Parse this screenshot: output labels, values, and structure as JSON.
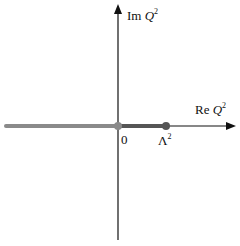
{
  "diagram": {
    "type": "complex-plane",
    "axes": {
      "imaginary_label_prefix": "Im",
      "imaginary_label_var": "Q",
      "imaginary_label_sup": "2",
      "real_label_prefix": "Re",
      "real_label_var": "Q",
      "real_label_sup": "2"
    },
    "points": {
      "origin_label": "0",
      "lambda_label": "Λ",
      "lambda_sup": "2"
    },
    "colors": {
      "axis": "#111111",
      "cut_left": "#8a8a8a",
      "cut_segment": "#555555",
      "origin_dot": "#8a8a8a",
      "lambda_dot": "#555555"
    }
  }
}
